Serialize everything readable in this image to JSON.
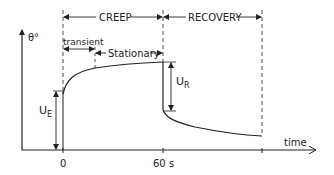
{
  "diagram": {
    "y_axis_label": "θ°",
    "x_axis_label": "time",
    "phases": {
      "creep": "CREEP",
      "recovery": "RECOVERY",
      "transient": "transient",
      "stationary": "Stationary"
    },
    "ticks": {
      "t0": "0",
      "t60": "60 s"
    },
    "annotations": {
      "ue_main": "U",
      "ue_sub": "E",
      "ur_main": "U",
      "ur_sub": "R"
    },
    "colors": {
      "line": "#222222",
      "background": "#ffffff"
    }
  }
}
